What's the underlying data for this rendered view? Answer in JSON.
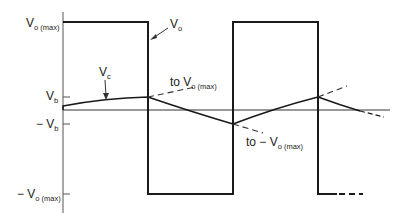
{
  "diagram": {
    "type": "waveform",
    "colors": {
      "stroke": "#1a1a1a",
      "text": "#222222",
      "background": "#ffffff"
    },
    "axis_labels": {
      "vo_max": {
        "main": "V",
        "sub": "o (max)"
      },
      "vb": {
        "main": "V",
        "sub": "b"
      },
      "neg_vb": {
        "main": "− V",
        "sub": "b"
      },
      "neg_vo_max": {
        "main": "− V",
        "sub": "o (max)"
      }
    },
    "annotations": {
      "vo": {
        "main": "V",
        "sub": "o"
      },
      "vc": {
        "main": "V",
        "sub": "c"
      },
      "to_vo_max": {
        "prefix": "to V",
        "sub": "o (max)"
      },
      "to_neg_vo_max": {
        "prefix": "to − V",
        "sub": "o (max)"
      }
    },
    "geometry": {
      "axis_x": 63,
      "axis_top": 12,
      "axis_bottom": 213,
      "y_vo_max": 22,
      "y_vb": 97,
      "y_zero": 110,
      "y_neg_vb": 124,
      "y_neg_vo_max": 194,
      "transitions_x": [
        63,
        148,
        233,
        318
      ],
      "baseline_end_x": 390
    }
  }
}
